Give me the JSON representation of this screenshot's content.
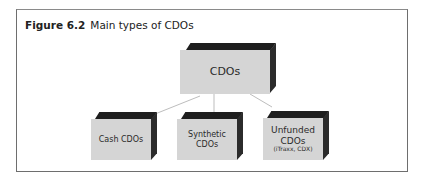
{
  "figure": {
    "label": "Figure 6.2",
    "title": "Main types of CDOs"
  },
  "diagram": {
    "root": {
      "label": "CDOs"
    },
    "children": [
      {
        "label_lines": [
          "Cash CDOs"
        ],
        "note": ""
      },
      {
        "label_lines": [
          "Synthetic",
          "CDOs"
        ],
        "note": ""
      },
      {
        "label_lines": [
          "Unfunded",
          "CDOs"
        ],
        "note": "(iTraxx, CDX)"
      }
    ]
  },
  "colors": {
    "box_face": "#d5d5d5",
    "box_edge": "#222222",
    "connector": "#bdbdbd",
    "frame": "#6e6e6e"
  }
}
